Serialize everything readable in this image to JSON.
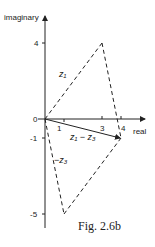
{
  "diagram": {
    "axes": {
      "y_label": "imaginary",
      "x_label": "real",
      "origin_label": "0",
      "y_ticks": [
        {
          "value": 4,
          "label": "4"
        },
        {
          "value": -1,
          "label": "-1"
        },
        {
          "value": -5,
          "label": "-5"
        }
      ],
      "x_ticks": [
        {
          "value": 1,
          "label": "1"
        },
        {
          "value": 3,
          "label": "3"
        },
        {
          "value": 4,
          "label": "4"
        }
      ]
    },
    "vectors": [
      {
        "name": "z1",
        "label": "z₁",
        "from": [
          0,
          0
        ],
        "to": [
          3,
          4
        ],
        "style": "dashed"
      },
      {
        "name": "z1-z3",
        "label": "z₁ − z₃",
        "from": [
          0,
          0
        ],
        "to": [
          4,
          -1
        ],
        "style": "solid"
      },
      {
        "name": "-z3",
        "label": "−z₃",
        "from": [
          0,
          0
        ],
        "to": [
          1,
          -5
        ],
        "style": "dashed"
      }
    ],
    "caption": "Fig. 2.6b"
  }
}
